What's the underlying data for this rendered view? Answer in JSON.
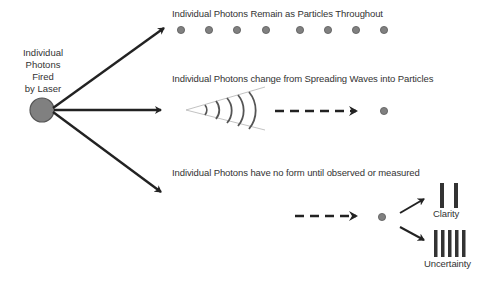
{
  "source": {
    "label_lines": [
      "Individual",
      "Photons",
      "Fired",
      "by Laser"
    ]
  },
  "paths": [
    {
      "id": "particles",
      "title": "Individual Photons Remain as Particles Throughout",
      "particle_count": 8
    },
    {
      "id": "waves",
      "title": "Individual Photons change from Spreading Waves into Particles",
      "wave_arc_count": 5
    },
    {
      "id": "formless",
      "title": "Individual Photons have no form until observed or measured",
      "outcomes": [
        {
          "label": "Clarity",
          "bar_count": 2
        },
        {
          "label": "Uncertainty",
          "bar_count": 5
        }
      ]
    }
  ],
  "colors": {
    "particle_fill": "#808080",
    "particle_stroke": "#5a5a5a",
    "arrow": "#222222",
    "text": "#333333",
    "bars": "#333333",
    "cone": "#bbbbbb",
    "arcs": "#555555"
  }
}
